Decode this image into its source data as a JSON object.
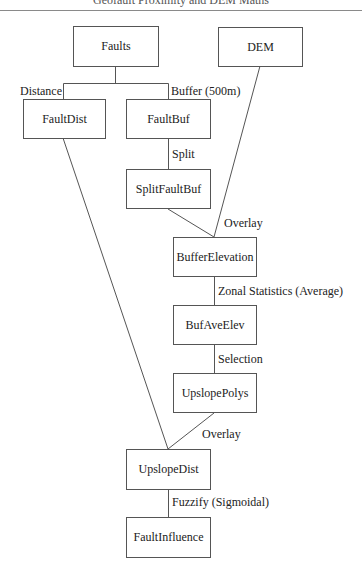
{
  "header": {
    "running_title": "Geofault Proximity and DEM Maths"
  },
  "diagram": {
    "nodes": [
      {
        "id": "faults",
        "label": "Faults"
      },
      {
        "id": "dem",
        "label": "DEM"
      },
      {
        "id": "faultdist",
        "label": "FaultDist"
      },
      {
        "id": "faultbuf",
        "label": "FaultBuf"
      },
      {
        "id": "splitfaultbuf",
        "label": "SplitFaultBuf"
      },
      {
        "id": "bufferelevation",
        "label": "BufferElevation"
      },
      {
        "id": "bufaveelev",
        "label": "BufAveElev"
      },
      {
        "id": "upslopepolys",
        "label": "UpslopePolys"
      },
      {
        "id": "upslopedist",
        "label": "UpslopeDist"
      },
      {
        "id": "faultinfluence",
        "label": "FaultInfluence"
      }
    ],
    "edge_labels": {
      "distance": "Distance",
      "buffer": "Buffer (500m)",
      "split": "Split",
      "overlay_1": "Overlay",
      "zonal": "Zonal Statistics (Average)",
      "selection": "Selection",
      "overlay_2": "Overlay",
      "fuzzify": "Fuzzify (Sigmoidal)"
    },
    "edges": [
      {
        "from": "faults",
        "to": "faultdist",
        "label": "Distance"
      },
      {
        "from": "faults",
        "to": "faultbuf",
        "label": "Buffer (500m)"
      },
      {
        "from": "faultbuf",
        "to": "splitfaultbuf",
        "label": "Split"
      },
      {
        "from": "splitfaultbuf",
        "to": "bufferelevation",
        "label": "Overlay"
      },
      {
        "from": "dem",
        "to": "bufferelevation",
        "label": "Overlay"
      },
      {
        "from": "bufferelevation",
        "to": "bufaveelev",
        "label": "Zonal Statistics (Average)"
      },
      {
        "from": "bufaveelev",
        "to": "upslopepolys",
        "label": "Selection"
      },
      {
        "from": "upslopepolys",
        "to": "upslopedist",
        "label": "Overlay"
      },
      {
        "from": "faultdist",
        "to": "upslopedist",
        "label": "Overlay"
      },
      {
        "from": "upslopedist",
        "to": "faultinfluence",
        "label": "Fuzzify (Sigmoidal)"
      }
    ]
  }
}
